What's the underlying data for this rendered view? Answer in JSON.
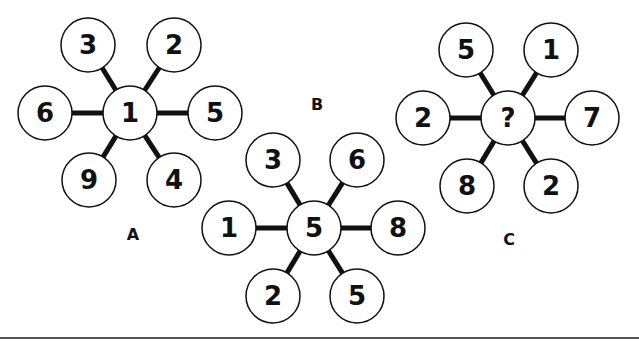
{
  "figures": [
    {
      "label": "A",
      "label_pos": [
        133,
        234
      ],
      "center": {
        "cx": 130,
        "cy": 113,
        "value": "1"
      },
      "spokes": [
        {
          "cx": 88,
          "cy": 45,
          "value": "3"
        },
        {
          "cx": 174,
          "cy": 45,
          "value": "2"
        },
        {
          "cx": 45,
          "cy": 113,
          "value": "6"
        },
        {
          "cx": 215,
          "cy": 113,
          "value": "5"
        },
        {
          "cx": 89,
          "cy": 180,
          "value": "9"
        },
        {
          "cx": 174,
          "cy": 180,
          "value": "4"
        }
      ]
    },
    {
      "label": "B",
      "label_pos": [
        317,
        104
      ],
      "center": {
        "cx": 314,
        "cy": 228,
        "value": "5"
      },
      "spokes": [
        {
          "cx": 273,
          "cy": 160,
          "value": "3"
        },
        {
          "cx": 357,
          "cy": 160,
          "value": "6"
        },
        {
          "cx": 229,
          "cy": 228,
          "value": "1"
        },
        {
          "cx": 398,
          "cy": 228,
          "value": "8"
        },
        {
          "cx": 273,
          "cy": 296,
          "value": "2"
        },
        {
          "cx": 357,
          "cy": 296,
          "value": "5"
        }
      ]
    },
    {
      "label": "C",
      "label_pos": [
        509,
        239
      ],
      "center": {
        "cx": 508,
        "cy": 118,
        "value": "?"
      },
      "spokes": [
        {
          "cx": 466,
          "cy": 50,
          "value": "5"
        },
        {
          "cx": 551,
          "cy": 50,
          "value": "1"
        },
        {
          "cx": 423,
          "cy": 118,
          "value": "2"
        },
        {
          "cx": 592,
          "cy": 118,
          "value": "7"
        },
        {
          "cx": 467,
          "cy": 186,
          "value": "8"
        },
        {
          "cx": 551,
          "cy": 186,
          "value": "2"
        }
      ]
    }
  ],
  "style": {
    "stroke": "#111111",
    "fill": "#ffffff",
    "radius": 27
  }
}
